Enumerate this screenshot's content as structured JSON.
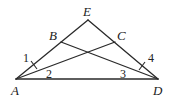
{
  "diagram": {
    "type": "geometry",
    "points": {
      "E": {
        "label": "E",
        "x": 88,
        "y": 20
      },
      "A": {
        "label": "A",
        "x": 16,
        "y": 79
      },
      "D": {
        "label": "D",
        "x": 158,
        "y": 79
      },
      "B": {
        "label": "B",
        "x": 61,
        "y": 42
      },
      "C": {
        "label": "C",
        "x": 115,
        "y": 42
      }
    },
    "angle_labels": {
      "a1": "1",
      "a2": "2",
      "a3": "3",
      "a4": "4"
    },
    "segments": [
      "AE",
      "ED",
      "AD",
      "AC",
      "BD"
    ],
    "tick_marks": [
      "AB",
      "CD"
    ]
  }
}
